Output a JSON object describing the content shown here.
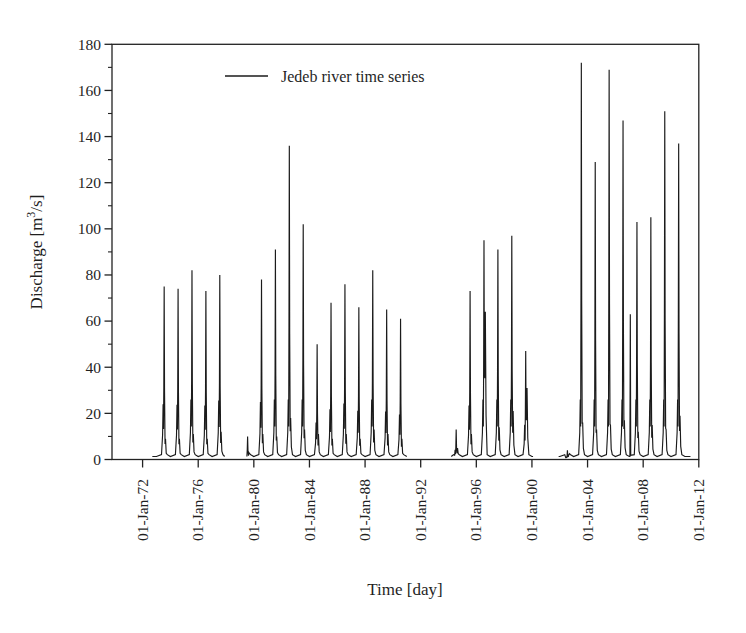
{
  "figure": {
    "background": "#ffffff",
    "line_color": "#1b1b1b",
    "axis_color": "#222222",
    "text_color": "#1f1f1f",
    "legend_label": "Jedeb river time series",
    "xlabel": "Time [day]",
    "ylabel_pre": "Discharge [m",
    "ylabel_sup": "3",
    "ylabel_post": "/s]"
  },
  "chart_data": {
    "type": "line",
    "title": "",
    "legend": [
      "Jedeb river time series"
    ],
    "legend_position": "top-inside",
    "xlabel": "Time [day]",
    "ylabel": "Discharge [m3/s]",
    "grid": false,
    "ylim": [
      0,
      180
    ],
    "ytick_step": 20,
    "ytick_minor_step": 10,
    "ytick_labels": [
      "0",
      "20",
      "40",
      "60",
      "80",
      "100",
      "120",
      "140",
      "160",
      "180"
    ],
    "xticks": [
      {
        "year": 1972,
        "label": "01-Jan-72"
      },
      {
        "year": 1976,
        "label": "01-Jan-76"
      },
      {
        "year": 1980,
        "label": "01-Jan-80"
      },
      {
        "year": 1984,
        "label": "01-Jan-84"
      },
      {
        "year": 1988,
        "label": "01-Jan-88"
      },
      {
        "year": 1992,
        "label": "01-Jan-92"
      },
      {
        "year": 1996,
        "label": "01-Jan-96"
      },
      {
        "year": 2000,
        "label": "01-Jan-00"
      },
      {
        "year": 2004,
        "label": "01-Jan-04"
      },
      {
        "year": 2008,
        "label": "01-Jan-08"
      },
      {
        "year": 2012,
        "label": "01-Jan-12"
      }
    ],
    "xlim_years": [
      1969.8,
      2012.0
    ],
    "baseline_flow": 1.3,
    "data_segments_years": [
      [
        1972.7,
        1977.9
      ],
      [
        1979.5,
        1991.0
      ],
      [
        1994.2,
        2000.08
      ],
      [
        2001.92,
        2011.4
      ]
    ],
    "annual_peaks": [
      {
        "year": 1973,
        "peak": 75,
        "sec": 9
      },
      {
        "year": 1974,
        "peak": 74,
        "sec": 9
      },
      {
        "year": 1975,
        "peak": 82,
        "sec": 11
      },
      {
        "year": 1976,
        "peak": 73,
        "sec": 9
      },
      {
        "year": 1977,
        "peak": 80,
        "sec": 12
      },
      {
        "year": 1979,
        "peak": 10,
        "sec": 3
      },
      {
        "year": 1980,
        "peak": 78,
        "sec": 11
      },
      {
        "year": 1981,
        "peak": 91,
        "sec": 10
      },
      {
        "year": 1982,
        "peak": 136,
        "sec": 18
      },
      {
        "year": 1983,
        "peak": 102,
        "sec": 13
      },
      {
        "year": 1984,
        "peak": 50,
        "sec": 11
      },
      {
        "year": 1985,
        "peak": 68,
        "sec": 9
      },
      {
        "year": 1986,
        "peak": 76,
        "sec": 11
      },
      {
        "year": 1987,
        "peak": 66,
        "sec": 9
      },
      {
        "year": 1988,
        "peak": 82,
        "sec": 13
      },
      {
        "year": 1989,
        "peak": 65,
        "sec": 11
      },
      {
        "year": 1990,
        "peak": 61,
        "sec": 9
      },
      {
        "year": 1994,
        "peak": 13,
        "sec": 5
      },
      {
        "year": 1995,
        "peak": 73,
        "sec": 11
      },
      {
        "year": 1996,
        "peak": 95,
        "sec": 64
      },
      {
        "year": 1997,
        "peak": 91,
        "sec": 14
      },
      {
        "year": 1998,
        "peak": 97,
        "sec": 21
      },
      {
        "year": 1999,
        "peak": 47,
        "sec": 31
      },
      {
        "year": 2002,
        "peak": 4,
        "sec": 2
      },
      {
        "year": 2003,
        "peak": 172,
        "sec": 16
      },
      {
        "year": 2004,
        "peak": 129,
        "sec": 13
      },
      {
        "year": 2005,
        "peak": 169,
        "sec": 15
      },
      {
        "year": 2006,
        "peak": 147,
        "sec": 17
      },
      {
        "year": 2007,
        "peak": 103,
        "sec": 12,
        "early": 63
      },
      {
        "year": 2008,
        "peak": 105,
        "sec": 15
      },
      {
        "year": 2009,
        "peak": 151,
        "sec": 13
      },
      {
        "year": 2010,
        "peak": 137,
        "sec": 19
      }
    ]
  }
}
